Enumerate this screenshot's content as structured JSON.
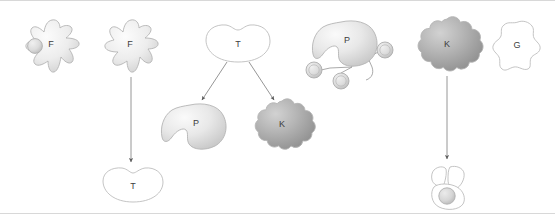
{
  "diagram": {
    "background_color": "#ffffff",
    "border_color": "#d8d8d8",
    "width": 555,
    "height": 214,
    "label_color": "#3d3d3d",
    "outline_color": "#bdbdbd",
    "arrow_color": "#5c5c5c",
    "fill_light": "#f2f2f2",
    "fill_mid": "#d9d9d9",
    "fill_dark": "#9e9e9e"
  },
  "nodes": [
    {
      "id": "f-cell-engulfing",
      "label": "F",
      "shape": "amoeboid-star",
      "filled": true,
      "has_particle": true,
      "x": 50,
      "y": 47
    },
    {
      "id": "f-cell-plain",
      "label": "F",
      "shape": "amoeboid-star",
      "filled": true,
      "has_particle": false,
      "x": 129,
      "y": 47
    },
    {
      "id": "t-cell-bottom",
      "label": "T",
      "shape": "kidney-bean",
      "filled": false,
      "x": 131,
      "y": 184
    },
    {
      "id": "t-cell-top",
      "label": "T",
      "shape": "kidney-bean",
      "filled": false,
      "x": 237,
      "y": 40
    },
    {
      "id": "p-cell-lower",
      "label": "P",
      "shape": "notched-blob",
      "filled": true,
      "x": 196,
      "y": 124
    },
    {
      "id": "k-cell-lower",
      "label": "K",
      "shape": "scalloped-cloud",
      "filled": true,
      "x": 282,
      "y": 124
    },
    {
      "id": "p-cell-antibody",
      "label": "P",
      "shape": "notched-blob",
      "filled": true,
      "x": 346,
      "y": 41
    },
    {
      "id": "k-cell-right",
      "label": "K",
      "shape": "scalloped-cloud",
      "filled": true,
      "x": 447,
      "y": 44
    },
    {
      "id": "g-cell",
      "label": "G",
      "shape": "wavy-square",
      "filled": false,
      "x": 519,
      "y": 43
    },
    {
      "id": "target-cell-lysed",
      "label": "",
      "shape": "lysed-target-cell",
      "filled": false,
      "x": 450,
      "y": 180
    }
  ],
  "antibody_particles": [
    {
      "id": "particle-right",
      "x": 385,
      "y": 49
    },
    {
      "id": "particle-left",
      "x": 314,
      "y": 69
    },
    {
      "id": "particle-bottom",
      "x": 341,
      "y": 79
    }
  ],
  "arrows": [
    {
      "id": "arrow-f-to-t",
      "from": "f-cell-plain",
      "to": "t-cell-bottom",
      "x1": 131,
      "y1": 76,
      "x2": 131,
      "y2": 163
    },
    {
      "id": "arrow-t-to-p",
      "from": "t-cell-top",
      "to": "p-cell-lower",
      "x1": 227,
      "y1": 60,
      "x2": 201,
      "y2": 100
    },
    {
      "id": "arrow-t-to-k",
      "from": "t-cell-top",
      "to": "k-cell-lower",
      "x1": 248,
      "y1": 60,
      "x2": 275,
      "y2": 100
    },
    {
      "id": "arrow-k-to-target",
      "from": "k-cell-right",
      "to": "target-cell-lysed",
      "x1": 447,
      "y1": 74,
      "x2": 447,
      "y2": 160
    }
  ]
}
